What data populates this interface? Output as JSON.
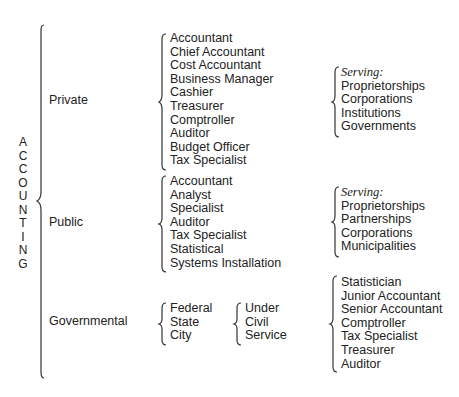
{
  "root": {
    "letters": [
      "A",
      "C",
      "C",
      "O",
      "U",
      "N",
      "T",
      "I",
      "N",
      "G"
    ],
    "title": "ACCOUNTING"
  },
  "branches": {
    "private": {
      "label": "Private",
      "roles": [
        "Accountant",
        "Chief Accountant",
        "Cost Accountant",
        "Business Manager",
        "Cashier",
        "Treasurer",
        "Comptroller",
        "Auditor",
        "Budget Officer",
        "Tax Specialist"
      ],
      "serving_label": "Serving:",
      "serving": [
        "Proprietorships",
        "Corporations",
        "Institutions",
        "Governments"
      ]
    },
    "public": {
      "label": "Public",
      "roles": [
        "Accountant",
        "Analyst",
        "Specialist",
        "Auditor",
        "Tax Specialist",
        "Statistical",
        "Systems Installation"
      ],
      "serving_label": "Serving:",
      "serving": [
        "Proprietorships",
        "Partnerships",
        "Corporations",
        "Municipalities"
      ]
    },
    "governmental": {
      "label": "Governmental",
      "levels": [
        "Federal",
        "State",
        "City"
      ],
      "civil_service": [
        "Under",
        "Civil",
        "Service"
      ],
      "roles": [
        "Statistician",
        "Junior Accountant",
        "Senior Accountant",
        "Comptroller",
        "Tax Specialist",
        "Treasurer",
        "Auditor"
      ]
    }
  }
}
